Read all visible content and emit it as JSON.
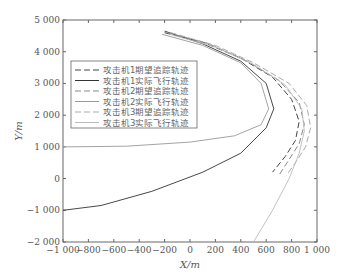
{
  "chart_data": {
    "type": "line",
    "title": "",
    "xlabel": "X/m",
    "ylabel": "Y/m",
    "xlim": [
      -1000,
      1000
    ],
    "ylim": [
      -2000,
      5000
    ],
    "xticks": [
      -1000,
      -800,
      -600,
      -400,
      -200,
      0,
      200,
      400,
      600,
      800,
      1000
    ],
    "xtick_labels": [
      "−1 000",
      "−800",
      "−600",
      "−400",
      "−200",
      "0",
      "200",
      "400",
      "600",
      "800",
      "1 000"
    ],
    "yticks": [
      -2000,
      -1000,
      0,
      1000,
      2000,
      3000,
      4000,
      5000
    ],
    "ytick_labels": [
      "−2 000",
      "−1 000",
      "0",
      "1 000",
      "2 000",
      "3 000",
      "4 000",
      "5 000"
    ],
    "grid": false,
    "legend_position": "upper left",
    "series": [
      {
        "name": "攻击机1期望追踪轨迹",
        "style": "dashed",
        "color": "#444",
        "x": [
          -200,
          100,
          400,
          650,
          800,
          860,
          830,
          750,
          650
        ],
        "y": [
          4600,
          4300,
          3800,
          3200,
          2500,
          1800,
          1200,
          700,
          200
        ]
      },
      {
        "name": "攻击机1实际飞行轨迹",
        "style": "solid",
        "color": "#333",
        "x": [
          -200,
          100,
          400,
          600,
          660,
          600,
          400,
          100,
          -300,
          -700,
          -1000
        ],
        "y": [
          4650,
          4250,
          3700,
          3000,
          2200,
          1600,
          800,
          200,
          -400,
          -850,
          -1000
        ]
      },
      {
        "name": "攻击机2期望追踪轨迹",
        "style": "dashed",
        "color": "#888",
        "x": [
          -180,
          150,
          450,
          700,
          860,
          900,
          860,
          780,
          700
        ],
        "y": [
          4600,
          4250,
          3700,
          3100,
          2400,
          1700,
          1100,
          600,
          100
        ]
      },
      {
        "name": "攻击机2实际飞行轨迹",
        "style": "solid",
        "color": "#999",
        "x": [
          -220,
          100,
          400,
          560,
          620,
          560,
          350,
          0,
          -500,
          -1000
        ],
        "y": [
          4550,
          4200,
          3650,
          3000,
          2200,
          1700,
          1350,
          1150,
          1020,
          1000
        ]
      },
      {
        "name": "攻击机3期望追踪轨迹",
        "style": "dashed",
        "color": "#aaa",
        "x": [
          -150,
          200,
          500,
          780,
          920,
          950,
          910,
          830,
          760
        ],
        "y": [
          4600,
          4200,
          3650,
          3000,
          2300,
          1600,
          1000,
          500,
          100
        ]
      },
      {
        "name": "攻击机3实际飞行轨迹",
        "style": "solid",
        "color": "#bbb",
        "x": [
          -160,
          200,
          500,
          750,
          880,
          900,
          860,
          780,
          650,
          500
        ],
        "y": [
          4550,
          4150,
          3600,
          2950,
          2200,
          1500,
          800,
          0,
          -1000,
          -2000
        ]
      }
    ]
  }
}
